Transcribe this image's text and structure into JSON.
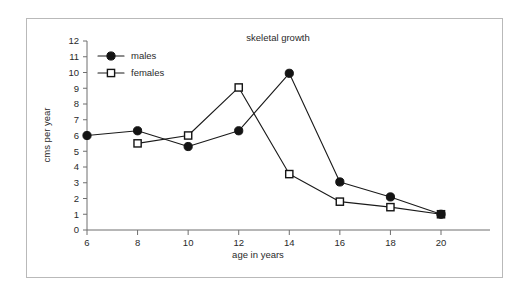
{
  "figure": {
    "background_color": "#ffffff",
    "border_color": "#b9b9b9",
    "ink_color": "#141414",
    "axis_color": "#6f6f6f"
  },
  "chart_data": {
    "type": "line",
    "title": "skeletal growth",
    "xlabel": "age in years",
    "ylabel": "cms per year",
    "x": [
      6,
      8,
      10,
      12,
      14,
      16,
      18,
      20
    ],
    "xticklabels": [
      "6",
      "8",
      "10",
      "12",
      "14",
      "16",
      "18",
      "20"
    ],
    "yticklabels": [
      "0",
      "1",
      "2",
      "3",
      "4",
      "5",
      "6",
      "7",
      "8",
      "9",
      "10",
      "11",
      "12"
    ],
    "xlim": [
      6,
      20
    ],
    "ylim": [
      0,
      12
    ],
    "grid": false,
    "legend_position": "upper left",
    "series": [
      {
        "name": "males",
        "marker": "filled-circle",
        "values": [
          6.0,
          6.3,
          5.3,
          6.3,
          9.95,
          3.05,
          2.1,
          1.0
        ]
      },
      {
        "name": "females",
        "marker": "open-square",
        "values": [
          null,
          5.5,
          6.0,
          9.05,
          3.55,
          1.8,
          1.45,
          1.0
        ]
      }
    ]
  }
}
